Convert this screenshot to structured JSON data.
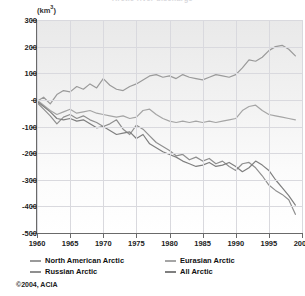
{
  "chart_data": {
    "type": "line",
    "title": "Arctic river discharge",
    "xlabel": "",
    "ylabel": "(km³)",
    "unit": "km3",
    "xlim": [
      1960,
      2000
    ],
    "ylim": [
      -500,
      300
    ],
    "xticks": [
      1960,
      1965,
      1970,
      1975,
      1980,
      1985,
      1990,
      1995,
      2000
    ],
    "yticks": [
      300,
      200,
      100,
      0,
      -100,
      -200,
      -300,
      -400,
      -500
    ],
    "grid": true,
    "legend_position": "below-axis",
    "series": [
      {
        "name": "North American Arctic",
        "color": "#9a9a9a",
        "x": [
          1960,
          1961,
          1962,
          1963,
          1964,
          1965,
          1966,
          1967,
          1968,
          1969,
          1970,
          1971,
          1972,
          1973,
          1974,
          1975,
          1976,
          1977,
          1978,
          1979,
          1980,
          1981,
          1982,
          1983,
          1984,
          1985,
          1986,
          1987,
          1988,
          1989,
          1990,
          1991,
          1992,
          1993,
          1994,
          1995,
          1996,
          1997,
          1998,
          1999
        ],
        "values": [
          -5,
          10,
          -15,
          20,
          35,
          30,
          50,
          40,
          60,
          45,
          80,
          55,
          40,
          35,
          50,
          60,
          75,
          90,
          95,
          85,
          90,
          80,
          95,
          85,
          80,
          75,
          85,
          95,
          90,
          85,
          95,
          120,
          150,
          145,
          160,
          185,
          200,
          205,
          190,
          165
        ]
      },
      {
        "name": "Eurasian Arctic",
        "color": "#a5a5a5",
        "x": [
          1960,
          1961,
          1962,
          1963,
          1964,
          1965,
          1966,
          1967,
          1968,
          1969,
          1970,
          1971,
          1972,
          1973,
          1974,
          1975,
          1976,
          1977,
          1978,
          1979,
          1980,
          1981,
          1982,
          1983,
          1984,
          1985,
          1986,
          1987,
          1988,
          1989,
          1990,
          1991,
          1992,
          1993,
          1994,
          1995,
          1996,
          1997,
          1998,
          1999
        ],
        "values": [
          0,
          -20,
          -40,
          -55,
          -45,
          -35,
          -50,
          -45,
          -40,
          -50,
          -55,
          -60,
          -65,
          -60,
          -70,
          -65,
          -40,
          -35,
          -55,
          -70,
          -80,
          -85,
          -80,
          -85,
          -80,
          -85,
          -80,
          -85,
          -80,
          -75,
          -70,
          -40,
          -25,
          -20,
          -40,
          -55,
          -60,
          -65,
          -70,
          -75
        ]
      },
      {
        "name": "Russian Arctic",
        "color": "#8f8f8f",
        "x": [
          1960,
          1961,
          1962,
          1963,
          1964,
          1965,
          1966,
          1967,
          1968,
          1969,
          1970,
          1971,
          1972,
          1973,
          1974,
          1975,
          1976,
          1977,
          1978,
          1979,
          1980,
          1981,
          1982,
          1983,
          1984,
          1985,
          1986,
          1987,
          1988,
          1989,
          1990,
          1991,
          1992,
          1993,
          1994,
          1995,
          1996,
          1997,
          1998,
          1999
        ],
        "values": [
          -10,
          -35,
          -60,
          -90,
          -65,
          -55,
          -70,
          -60,
          -75,
          -85,
          -100,
          -90,
          -75,
          -110,
          -130,
          -95,
          -110,
          -135,
          -160,
          -175,
          -190,
          -210,
          -205,
          -225,
          -215,
          -230,
          -220,
          -240,
          -230,
          -250,
          -265,
          -240,
          -235,
          -255,
          -285,
          -320,
          -340,
          -355,
          -375,
          -430
        ]
      },
      {
        "name": "All Arctic",
        "color": "#7f7f7f",
        "x": [
          1960,
          1961,
          1962,
          1963,
          1964,
          1965,
          1966,
          1967,
          1968,
          1969,
          1970,
          1971,
          1972,
          1973,
          1974,
          1975,
          1976,
          1977,
          1978,
          1979,
          1980,
          1981,
          1982,
          1983,
          1984,
          1985,
          1986,
          1987,
          1988,
          1989,
          1990,
          1991,
          1992,
          1993,
          1994,
          1995,
          1996,
          1997,
          1998,
          1999
        ],
        "values": [
          -5,
          -25,
          -45,
          -70,
          -75,
          -70,
          -80,
          -75,
          -90,
          -105,
          -100,
          -115,
          -130,
          -125,
          -120,
          -145,
          -130,
          -165,
          -180,
          -195,
          -205,
          -215,
          -230,
          -240,
          -250,
          -245,
          -235,
          -250,
          -245,
          -235,
          -250,
          -270,
          -255,
          -230,
          -245,
          -265,
          -300,
          -330,
          -360,
          -395
        ]
      }
    ]
  },
  "axis": {
    "unit_prefix": "(km",
    "unit_sup": "3",
    "unit_suffix": ")"
  },
  "legend": {
    "items": [
      {
        "label": "North American Arctic",
        "color": "#9a9a9a"
      },
      {
        "label": "Eurasian Arctic",
        "color": "#a5a5a5"
      },
      {
        "label": "Russian Arctic",
        "color": "#8f8f8f"
      },
      {
        "label": "All Arctic",
        "color": "#7f7f7f"
      }
    ]
  },
  "footer": {
    "copyright": "©2004, ACIA"
  }
}
